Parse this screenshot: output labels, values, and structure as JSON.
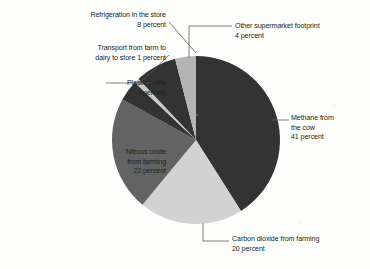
{
  "chart_data": {
    "type": "pie",
    "title": "",
    "subtitle": "",
    "xlabel": "",
    "ylabel": "",
    "grid": false,
    "legend_position": "none",
    "label_suffix": "percent",
    "total": 100,
    "start_angle_deg": 0,
    "direction": "clockwise",
    "categories": [
      "Methane from the cow",
      "Carbon dioxide from farming",
      "Nitrous oxide from farming",
      "Plastic bottle",
      "Transport from farm to dairy to store",
      "Refrigeration in the store",
      "Other supermarket footprint"
    ],
    "values": [
      41,
      20,
      22,
      4,
      1,
      8,
      4
    ],
    "colors": [
      "#333333",
      "#d2d2d2",
      "#636363",
      "#333333",
      "#c9c9c9",
      "#333333",
      "#b4b4b4"
    ],
    "slices": [
      {
        "name": "Methane from the cow",
        "value": 41,
        "color": "#333333",
        "label_lines": [
          "Methane from",
          "the cow",
          "41 percent"
        ]
      },
      {
        "name": "Carbon dioxide from farming",
        "value": 20,
        "color": "#d2d2d2",
        "label_lines": [
          "Carbon dioxide from farming",
          "20 percent"
        ]
      },
      {
        "name": "Nitrous oxide from farming",
        "value": 22,
        "color": "#636363",
        "label_lines": [
          "Nitrous oxide",
          "from farming",
          "22 percent"
        ]
      },
      {
        "name": "Plastic bottle",
        "value": 4,
        "color": "#333333",
        "label_lines": [
          "Plastic bottle",
          "4 percent"
        ]
      },
      {
        "name": "Transport from farm to dairy to store",
        "value": 1,
        "color": "#c9c9c9",
        "label_lines": [
          "Transport from farm to",
          "dairy to store 1 percent"
        ]
      },
      {
        "name": "Refrigeration in the store",
        "value": 8,
        "color": "#333333",
        "label_lines": [
          "Refrigeration in the store",
          "8 percent"
        ]
      },
      {
        "name": "Other supermarket footprint",
        "value": 4,
        "color": "#b4b4b4",
        "label_lines": [
          "Other supermarket footprint",
          "4 percent"
        ]
      }
    ]
  },
  "labels": {
    "refrigeration": "Refrigeration in the store\n8 percent",
    "transport": "Transport from farm to\ndairy to store 1 percent",
    "plastic": "Plastic bottle\n4 percent",
    "nitrous": "Nitrous oxide\nfrom farming\n22 percent",
    "other": "Other supermarket footprint\n4 percent",
    "methane": "Methane from\nthe cow\n41 percent",
    "carbon": "Carbon dioxide from farming\n20 percent"
  }
}
